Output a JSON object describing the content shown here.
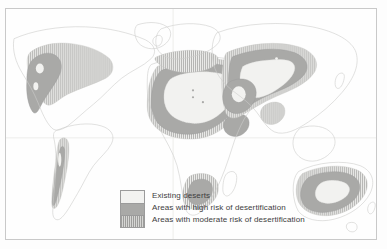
{
  "figure": {
    "kind": "thematic-world-map",
    "projection_hint": "cylindrical world map with faint graticule"
  },
  "legend": {
    "items": [
      {
        "id": "existing-deserts",
        "label": "Existing deserts",
        "swatch_style": "solid-light",
        "color": "#f2f2f0"
      },
      {
        "id": "high-risk",
        "label": "Areas with high risk of desertification",
        "swatch_style": "solid-medium-gray",
        "color": "#a9a9a7"
      },
      {
        "id": "moderate-risk",
        "label": "Areas with moderate risk of desertification",
        "swatch_style": "vertical-hatch",
        "color": "#9d9d9b"
      }
    ]
  },
  "palette": {
    "page_background": "#fdfdfd",
    "map_background": "#fefefe",
    "frame_border": "#c9c9c9",
    "land_fill": "#f7f7f6",
    "land_stroke": "#cfcfcd",
    "graticule": "#e8e8e6",
    "existing_desert": "#f2f2f0",
    "high_risk": "#a9a9a7",
    "moderate_risk": "#9d9d9b",
    "label_text": "#3d3d3d"
  },
  "regions": {
    "existing_deserts": [
      "Sahara core",
      "Arabian Peninsula interior",
      "Central Asian basins",
      "Gobi",
      "Great Victoria / Australian interior",
      "Atacama strip",
      "Great Basin / Mojave"
    ],
    "high_risk": [
      "Sahel / Sahara margins",
      "Middle East",
      "Central Asia",
      "Horn of Africa",
      "Western United States / northern Mexico",
      "Kalahari margins",
      "Australian interior margins"
    ],
    "moderate_risk": [
      "North African coastal belt",
      "Mediterranean fringe",
      "Southern Africa",
      "Patagonia / Andes foothills",
      "Great Plains",
      "Southern Australia",
      "Inner Asia steppe"
    ]
  }
}
